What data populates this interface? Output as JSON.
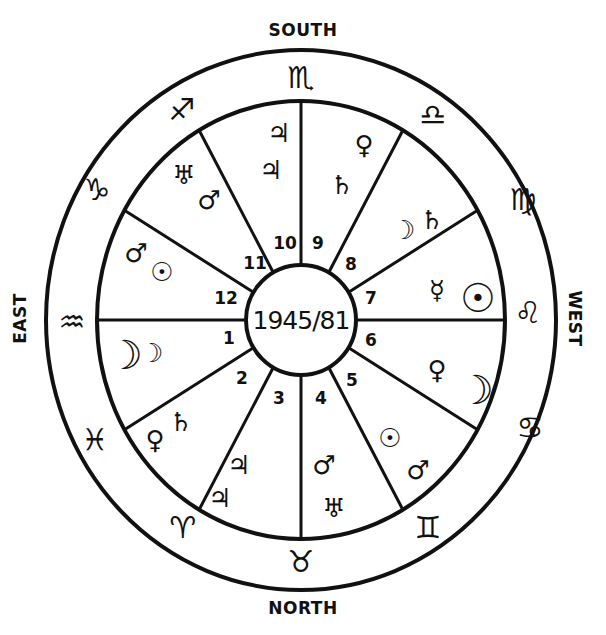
{
  "center_label": "1945/81",
  "directions": {
    "south": "SOUTH",
    "north": "NORTH",
    "east": "EAST",
    "west": "WEST"
  },
  "colors": {
    "ink": "#111111",
    "background": "#ffffff"
  },
  "zodiac_signs": [
    {
      "name": "scorpio",
      "glyph": "♏",
      "position": "top"
    },
    {
      "name": "libra",
      "glyph": "♎",
      "position": "top-right"
    },
    {
      "name": "virgo",
      "glyph": "♍",
      "position": "upper-right"
    },
    {
      "name": "leo",
      "glyph": "♌",
      "position": "right"
    },
    {
      "name": "cancer",
      "glyph": "♋",
      "position": "lower-right"
    },
    {
      "name": "gemini",
      "glyph": "♊",
      "position": "bottom-right"
    },
    {
      "name": "taurus",
      "glyph": "♉",
      "position": "bottom"
    },
    {
      "name": "aries",
      "glyph": "♈",
      "position": "bottom-left"
    },
    {
      "name": "pisces",
      "glyph": "♓",
      "position": "lower-left"
    },
    {
      "name": "aquarius",
      "glyph": "♒",
      "position": "left"
    },
    {
      "name": "capricorn",
      "glyph": "♑",
      "position": "upper-left"
    },
    {
      "name": "sagittarius",
      "glyph": "♐",
      "position": "top-left"
    }
  ],
  "houses": [
    {
      "number": "1",
      "planets": [
        {
          "name": "moon",
          "glyph": "☽"
        },
        {
          "name": "moon",
          "glyph": "☽"
        }
      ]
    },
    {
      "number": "2",
      "planets": [
        {
          "name": "venus",
          "glyph": "♀"
        },
        {
          "name": "saturn",
          "glyph": "♄"
        }
      ]
    },
    {
      "number": "3",
      "planets": [
        {
          "name": "jupiter",
          "glyph": "♃"
        },
        {
          "name": "jupiter",
          "glyph": "♃"
        }
      ]
    },
    {
      "number": "4",
      "planets": [
        {
          "name": "mars",
          "glyph": "♂"
        },
        {
          "name": "uranus",
          "glyph": "♅"
        }
      ]
    },
    {
      "number": "5",
      "planets": [
        {
          "name": "sun",
          "glyph": "☉"
        },
        {
          "name": "mars",
          "glyph": "♂"
        }
      ]
    },
    {
      "number": "6",
      "planets": [
        {
          "name": "venus",
          "glyph": "♀"
        },
        {
          "name": "moon",
          "glyph": "☽"
        }
      ]
    },
    {
      "number": "7",
      "planets": [
        {
          "name": "mercury",
          "glyph": "☿"
        },
        {
          "name": "sun",
          "glyph": "☉"
        }
      ]
    },
    {
      "number": "8",
      "planets": [
        {
          "name": "moon",
          "glyph": "☽"
        },
        {
          "name": "saturn",
          "glyph": "♄"
        }
      ]
    },
    {
      "number": "9",
      "planets": [
        {
          "name": "venus",
          "glyph": "♀"
        },
        {
          "name": "saturn",
          "glyph": "♄"
        }
      ]
    },
    {
      "number": "10",
      "planets": [
        {
          "name": "jupiter",
          "glyph": "♃"
        },
        {
          "name": "jupiter",
          "glyph": "♃"
        }
      ]
    },
    {
      "number": "11",
      "planets": [
        {
          "name": "uranus",
          "glyph": "♅"
        },
        {
          "name": "mars",
          "glyph": "♂"
        }
      ]
    },
    {
      "number": "12",
      "planets": [
        {
          "name": "mars",
          "glyph": "♂"
        },
        {
          "name": "sun",
          "glyph": "☉"
        }
      ]
    }
  ]
}
